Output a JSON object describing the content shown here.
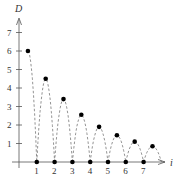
{
  "chart_data": {
    "type": "scatter",
    "title": "",
    "xlabel": "i",
    "ylabel": "D",
    "xlim": [
      0,
      8
    ],
    "ylim": [
      0,
      7.5
    ],
    "x_ticks": [
      1,
      2,
      3,
      4,
      5,
      6,
      7
    ],
    "y_ticks": [
      1,
      2,
      3,
      4,
      5,
      6,
      7
    ],
    "grid": false,
    "legend": null,
    "series": [
      {
        "name": "peak heights",
        "marker": "filled-circle",
        "points": [
          {
            "x": 0.5,
            "y": 6.0
          },
          {
            "x": 1.5,
            "y": 4.5
          },
          {
            "x": 2.5,
            "y": 3.4
          },
          {
            "x": 3.5,
            "y": 2.55
          },
          {
            "x": 4.5,
            "y": 1.9
          },
          {
            "x": 5.5,
            "y": 1.45
          },
          {
            "x": 6.5,
            "y": 1.1
          },
          {
            "x": 7.5,
            "y": 0.85
          }
        ]
      },
      {
        "name": "bounce points",
        "marker": "filled-circle",
        "points": [
          {
            "x": 1,
            "y": 0
          },
          {
            "x": 2,
            "y": 0
          },
          {
            "x": 3,
            "y": 0
          },
          {
            "x": 4,
            "y": 0
          },
          {
            "x": 5,
            "y": 0
          },
          {
            "x": 6,
            "y": 0
          },
          {
            "x": 7,
            "y": 0
          }
        ]
      }
    ],
    "annotations": [
      "dashed parabolic arcs connect successive bounce points through each peak"
    ]
  },
  "axes": {
    "x_title": "i",
    "y_title": "D",
    "x_tick_labels": [
      "1",
      "2",
      "3",
      "4",
      "5",
      "6",
      "7"
    ],
    "y_tick_labels": [
      "1",
      "2",
      "3",
      "4",
      "5",
      "6",
      "7"
    ]
  },
  "colors": {
    "axis": "#555555",
    "dots": "#000000",
    "dashes": "#777777"
  }
}
